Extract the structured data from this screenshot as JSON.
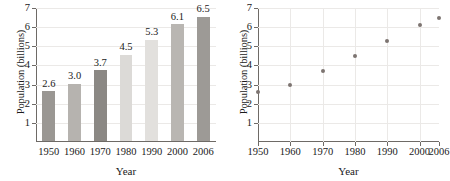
{
  "chart_data": [
    {
      "type": "bar",
      "panel": "left",
      "title": "",
      "xlabel": "Year",
      "ylabel": "Population (billions)",
      "categories": [
        "1950",
        "1960",
        "1970",
        "1980",
        "1990",
        "2000",
        "2006"
      ],
      "values": [
        2.6,
        3.0,
        3.7,
        4.5,
        5.3,
        6.1,
        6.5
      ],
      "value_labels": [
        "2.6",
        "3.0",
        "3.7",
        "4.5",
        "5.3",
        "6.1",
        "6.5"
      ],
      "bar_colors": [
        "#9a9793",
        "#b6b3af",
        "#8b8884",
        "#dcdad7",
        "#e2e0dd",
        "#b9b6b2",
        "#9d9a96"
      ],
      "ylim": [
        0,
        7
      ],
      "yticks": [
        1,
        2,
        3,
        4,
        5,
        6,
        7
      ],
      "ytick_labels": [
        "1",
        "2",
        "3",
        "4",
        "5",
        "6",
        "7"
      ],
      "grid": "horizontal",
      "legend": "none"
    },
    {
      "type": "scatter",
      "panel": "right",
      "title": "",
      "xlabel": "Year",
      "ylabel": "Population (billions)",
      "x": [
        "1950",
        "1960",
        "1970",
        "1980",
        "1990",
        "2000",
        "2006"
      ],
      "values": [
        2.6,
        3.0,
        3.7,
        4.5,
        5.3,
        6.1,
        6.5
      ],
      "marker_color": "#7d7471",
      "ylim": [
        0,
        7
      ],
      "yticks": [
        1,
        2,
        3,
        4,
        5,
        6,
        7
      ],
      "ytick_labels": [
        "1",
        "2",
        "3",
        "4",
        "5",
        "6",
        "7"
      ],
      "xticks": [
        "1950",
        "1960",
        "1970",
        "1980",
        "1990",
        "2000",
        "2006"
      ],
      "grid": "both",
      "legend": "none"
    }
  ],
  "colors": {
    "axis": "#6e6a66",
    "grid": "#ebe9e7",
    "text": "#1a1a1a",
    "background": "#ffffff"
  }
}
